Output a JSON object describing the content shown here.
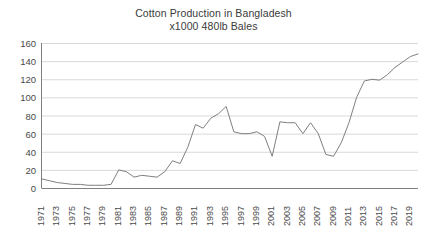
{
  "chart_data": {
    "type": "line",
    "title": "Cotton Production in Bangladesh",
    "subtitle": "x1000 480lb Bales",
    "xlabel": "",
    "ylabel": "",
    "ylim": [
      0,
      160
    ],
    "yticks": [
      0,
      20,
      40,
      60,
      80,
      100,
      120,
      140,
      160
    ],
    "xlim": [
      1971,
      2020
    ],
    "xticks": [
      1971,
      1973,
      1975,
      1977,
      1979,
      1981,
      1983,
      1985,
      1987,
      1989,
      1991,
      1993,
      1995,
      1997,
      1999,
      2001,
      2003,
      2005,
      2007,
      2009,
      2011,
      2013,
      2015,
      2017,
      2019
    ],
    "xtick_rotation": -90,
    "grid": "horizontal",
    "legend": "none",
    "line_color": "#7f7f7f",
    "x": [
      1971,
      1972,
      1973,
      1974,
      1975,
      1976,
      1977,
      1978,
      1979,
      1980,
      1981,
      1982,
      1983,
      1984,
      1985,
      1986,
      1987,
      1988,
      1989,
      1990,
      1991,
      1992,
      1993,
      1994,
      1995,
      1996,
      1997,
      1998,
      1999,
      2000,
      2001,
      2002,
      2003,
      2004,
      2005,
      2006,
      2007,
      2008,
      2009,
      2010,
      2011,
      2012,
      2013,
      2014,
      2015,
      2016,
      2017,
      2018,
      2019,
      2020
    ],
    "values": [
      10,
      8,
      6,
      5,
      4,
      4,
      3,
      3,
      3,
      4,
      20,
      18,
      12,
      14,
      13,
      12,
      18,
      30,
      27,
      45,
      70,
      66,
      77,
      82,
      90,
      62,
      60,
      60,
      62,
      57,
      35,
      73,
      72,
      72,
      60,
      72,
      60,
      37,
      35,
      50,
      72,
      100,
      118,
      120,
      119,
      125,
      133,
      139,
      145,
      148
    ],
    "series": [
      {
        "name": "Cotton Production",
        "values": [
          10,
          8,
          6,
          5,
          4,
          4,
          3,
          3,
          3,
          4,
          20,
          18,
          12,
          14,
          13,
          12,
          18,
          30,
          27,
          45,
          70,
          66,
          77,
          82,
          90,
          62,
          60,
          60,
          62,
          57,
          35,
          73,
          72,
          72,
          60,
          72,
          60,
          37,
          35,
          50,
          72,
          100,
          118,
          120,
          119,
          125,
          133,
          139,
          145,
          148
        ]
      }
    ],
    "annotations": []
  },
  "axis": {
    "y_tick_labels": [
      "160",
      "140",
      "120",
      "100",
      "80",
      "60",
      "40",
      "20",
      "0"
    ],
    "x_tick_labels": [
      "1971",
      "1973",
      "1975",
      "1977",
      "1979",
      "1981",
      "1983",
      "1985",
      "1987",
      "1989",
      "1991",
      "1993",
      "1995",
      "1997",
      "1999",
      "2001",
      "2003",
      "2005",
      "2007",
      "2009",
      "2011",
      "2013",
      "2015",
      "2017",
      "2019"
    ]
  },
  "colors": {
    "line": "#7f7f7f",
    "grid": "#d9d9d9",
    "axis": "#808080",
    "text": "#404040",
    "background": "#ffffff"
  }
}
